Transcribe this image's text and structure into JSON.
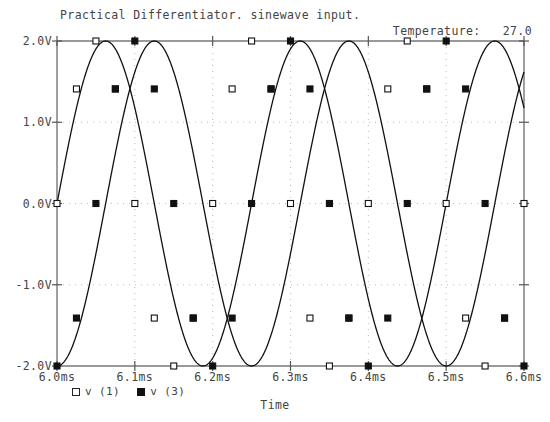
{
  "header": {
    "title": "Practical Differentiator. sinewave input.",
    "temperature_label": "Temperature:",
    "temperature_value": "27.0"
  },
  "axes": {
    "x_caption": "Time",
    "x_ticks": [
      "6.0ms",
      "6.1ms",
      "6.2ms",
      "6.3ms",
      "6.4ms",
      "6.5ms",
      "6.6ms"
    ],
    "y_ticks": [
      "2.0V",
      "1.0V",
      "0.0V",
      "-1.0V",
      "-2.0V"
    ]
  },
  "legend": [
    {
      "label": "v (1)",
      "marker": "open-square",
      "color": "#111111"
    },
    {
      "label": "v (3)",
      "marker": "filled-square",
      "color": "#111111"
    }
  ],
  "chart_data": {
    "type": "line",
    "title": "Practical Differentiator. sinewave input.",
    "xlabel": "Time",
    "ylabel": "",
    "xlim": [
      6.0,
      6.6
    ],
    "ylim": [
      -2.0,
      2.0
    ],
    "x_unit": "ms",
    "y_unit": "V",
    "grid": true,
    "legend_position": "bottom-left",
    "annotations": [
      {
        "text": "Temperature:  27.0",
        "position": "top-right"
      }
    ],
    "series": [
      {
        "name": "v (1)",
        "marker": "open-square",
        "color": "#111111",
        "amplitude": 2.0,
        "period_ms": 0.25,
        "phase_deg": 0,
        "marker_x": [
          6.0,
          6.025,
          6.05,
          6.075,
          6.1,
          6.125,
          6.15,
          6.175,
          6.2,
          6.225,
          6.25,
          6.275,
          6.3,
          6.325,
          6.35,
          6.375,
          6.4,
          6.425,
          6.45,
          6.475,
          6.5,
          6.525,
          6.55,
          6.575,
          6.6
        ],
        "marker_y": [
          0.0,
          1.41,
          2.0,
          1.41,
          0.0,
          -1.41,
          -2.0,
          -1.41,
          0.0,
          1.41,
          2.0,
          1.41,
          0.0,
          -1.41,
          -2.0,
          -1.41,
          0.0,
          1.41,
          2.0,
          1.41,
          0.0,
          -1.41,
          -2.0,
          -1.41,
          0.0
        ]
      },
      {
        "name": "v (3)",
        "marker": "filled-square",
        "color": "#111111",
        "amplitude": 2.0,
        "period_ms": 0.25,
        "phase_deg": -90,
        "marker_x": [
          6.0,
          6.025,
          6.05,
          6.075,
          6.1,
          6.125,
          6.15,
          6.175,
          6.2,
          6.225,
          6.25,
          6.275,
          6.3,
          6.325,
          6.35,
          6.375,
          6.4,
          6.425,
          6.45,
          6.475,
          6.5,
          6.525,
          6.55,
          6.575,
          6.6
        ],
        "marker_y": [
          -2.0,
          -1.41,
          0.0,
          1.41,
          2.0,
          1.41,
          0.0,
          -1.41,
          -2.0,
          -1.41,
          0.0,
          1.41,
          2.0,
          1.41,
          0.0,
          -1.41,
          -2.0,
          -1.41,
          0.0,
          1.41,
          2.0,
          1.41,
          0.0,
          -1.41,
          -2.0
        ]
      }
    ]
  }
}
